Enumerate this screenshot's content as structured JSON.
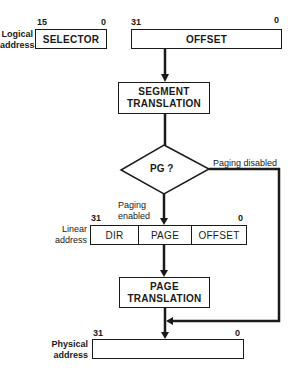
{
  "logical_address": {
    "label_line1": "Logical",
    "label_line2": "address",
    "selector": {
      "label": "SELECTOR",
      "bit_high": "15",
      "bit_low": "0"
    },
    "offset": {
      "label": "OFFSET",
      "bit_high": "31",
      "bit_low": "0"
    }
  },
  "segment_translation": {
    "line1": "SEGMENT",
    "line2": "TRANSLATION"
  },
  "decision": {
    "label": "PG ?",
    "branch_disabled": "Paging disabled",
    "branch_enabled_line1": "Paging",
    "branch_enabled_line2": "enabled"
  },
  "linear_address": {
    "label_line1": "Linear",
    "label_line2": "address",
    "bit_high": "31",
    "bit_low": "0",
    "fields": [
      "DIR",
      "PAGE",
      "OFFSET"
    ]
  },
  "page_translation": {
    "line1": "PAGE",
    "line2": "TRANSLATION"
  },
  "physical_address": {
    "label_line1": "Physical",
    "label_line2": "address",
    "bit_high": "31",
    "bit_low": "0"
  },
  "colors": {
    "ink": "#1a1a1a",
    "background": "#ffffff"
  }
}
